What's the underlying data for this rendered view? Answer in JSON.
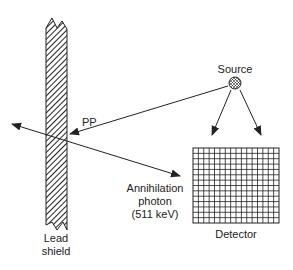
{
  "labels": {
    "source": "Source",
    "pp": "PP",
    "annihilation_line1": "Annihilation",
    "annihilation_line2": "photon",
    "annihilation_line3": "(511 keV)",
    "shield_line1": "Lead",
    "shield_line2": "shield",
    "detector": "Detector"
  },
  "detector_grid": {
    "columns": 16,
    "rows": 14
  },
  "colors": {
    "stroke": "#222222",
    "background": "#ffffff"
  }
}
